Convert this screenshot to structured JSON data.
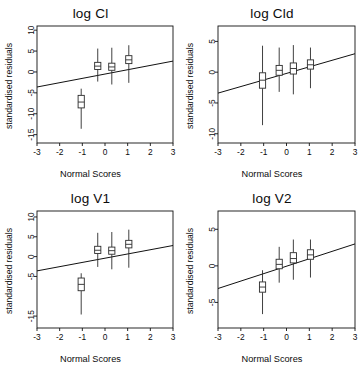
{
  "figure": {
    "background": "#ffffff",
    "layout": "2x2 grid of normal-score diagnostic box plots",
    "shared_xlabel": "Normal Scores",
    "shared_ylabel": "standardised residuals"
  },
  "chart_data": [
    {
      "type": "box",
      "title": "log Cl",
      "xlabel": "Normal Scores",
      "ylabel": "standardised residuals",
      "xlim": [
        -3,
        3
      ],
      "ylim": [
        -17,
        11
      ],
      "xticks": [
        -3,
        -2,
        -1,
        0,
        1,
        2,
        3
      ],
      "xticklabels": [
        "-3",
        "-2",
        "-1",
        "0",
        "1",
        "2",
        "3"
      ],
      "yticks": [
        -15,
        -10,
        -5,
        0,
        5,
        10
      ],
      "yticklabels": [
        "-15",
        "-10",
        "-5",
        "0",
        "5",
        "10"
      ],
      "grid": false,
      "legend": null,
      "boxes": [
        {
          "x": -1.05,
          "whisker_low": -13.6,
          "q1": -8.6,
          "median": -7.2,
          "q3": -5.6,
          "whisker_high": -4.0
        },
        {
          "x": -0.32,
          "whisker_low": -2.3,
          "q1": 0.6,
          "median": 1.4,
          "q3": 2.3,
          "whisker_high": 5.6
        },
        {
          "x": 0.3,
          "whisker_low": -3.0,
          "q1": 0.4,
          "median": 1.2,
          "q3": 2.1,
          "whisker_high": 5.8
        },
        {
          "x": 1.05,
          "whisker_low": -2.6,
          "q1": 2.0,
          "median": 2.9,
          "q3": 3.9,
          "whisker_high": 6.4
        }
      ],
      "reference_line": {
        "x0": -3,
        "y0": -3.6,
        "x1": 3,
        "y1": 2.6
      }
    },
    {
      "type": "box",
      "title": "log Cld",
      "xlabel": "Normal Scores",
      "ylabel": "standardised residuals",
      "xlim": [
        -3,
        3
      ],
      "ylim": [
        -11.5,
        7.5
      ],
      "xticks": [
        -3,
        -2,
        -1,
        0,
        1,
        2,
        3
      ],
      "xticklabels": [
        "-3",
        "-2",
        "-1",
        "0",
        "1",
        "2",
        "3"
      ],
      "yticks": [
        -10,
        -5,
        0,
        5
      ],
      "yticklabels": [
        "-10",
        "-5",
        "0",
        "5"
      ],
      "grid": false,
      "legend": null,
      "boxes": [
        {
          "x": -1.05,
          "whisker_low": -8.6,
          "q1": -2.6,
          "median": -1.3,
          "q3": -0.1,
          "whisker_high": 4.3
        },
        {
          "x": -0.32,
          "whisker_low": -3.2,
          "q1": -0.5,
          "median": 0.3,
          "q3": 1.1,
          "whisker_high": 4.0
        },
        {
          "x": 0.3,
          "whisker_low": -3.6,
          "q1": -0.3,
          "median": 0.6,
          "q3": 1.5,
          "whisker_high": 4.4
        },
        {
          "x": 1.05,
          "whisker_low": -2.6,
          "q1": 0.5,
          "median": 1.2,
          "q3": 2.0,
          "whisker_high": 4.0
        }
      ],
      "reference_line": {
        "x0": -3,
        "y0": -3.4,
        "x1": 3,
        "y1": 3.0
      }
    },
    {
      "type": "box",
      "title": "log V1",
      "xlabel": "Normal Scores",
      "ylabel": "standardised residuals",
      "xlim": [
        -3,
        3
      ],
      "ylim": [
        -18,
        11.5
      ],
      "xticks": [
        -3,
        -2,
        -1,
        0,
        1,
        2,
        3
      ],
      "xticklabels": [
        "-3",
        "-2",
        "-1",
        "0",
        "1",
        "2",
        "3"
      ],
      "yticks": [
        -15,
        -5,
        0,
        5,
        10
      ],
      "yticklabels": [
        "-15",
        "-5",
        "0",
        "5",
        "10"
      ],
      "grid": false,
      "legend": null,
      "boxes": [
        {
          "x": -1.05,
          "whisker_low": -14.6,
          "q1": -8.6,
          "median": -7.0,
          "q3": -5.4,
          "whisker_high": -4.2
        },
        {
          "x": -0.32,
          "whisker_low": -2.6,
          "q1": 0.8,
          "median": 1.6,
          "q3": 2.6,
          "whisker_high": 6.0
        },
        {
          "x": 0.3,
          "whisker_low": -3.2,
          "q1": 0.6,
          "median": 1.5,
          "q3": 2.4,
          "whisker_high": 6.2
        },
        {
          "x": 1.05,
          "whisker_low": -2.8,
          "q1": 2.2,
          "median": 3.1,
          "q3": 4.1,
          "whisker_high": 6.8
        }
      ],
      "reference_line": {
        "x0": -3,
        "y0": -3.6,
        "x1": 3,
        "y1": 2.8
      }
    },
    {
      "type": "box",
      "title": "log V2",
      "xlabel": "Normal Scores",
      "ylabel": "standardised residuals",
      "xlim": [
        -3,
        3
      ],
      "ylim": [
        -8.5,
        7.5
      ],
      "xticks": [
        -3,
        -2,
        -1,
        0,
        1,
        2,
        3
      ],
      "xticklabels": [
        "-3",
        "-2",
        "-1",
        "0",
        "1",
        "2",
        "3"
      ],
      "yticks": [
        -5,
        0,
        5
      ],
      "yticklabels": [
        "-5",
        "0",
        "5"
      ],
      "grid": false,
      "legend": null,
      "boxes": [
        {
          "x": -1.05,
          "whisker_low": -6.6,
          "q1": -3.6,
          "median": -2.9,
          "q3": -2.2,
          "whisker_high": -0.6
        },
        {
          "x": -0.32,
          "whisker_low": -2.3,
          "q1": -0.4,
          "median": 0.2,
          "q3": 0.9,
          "whisker_high": 2.6
        },
        {
          "x": 0.3,
          "whisker_low": -1.9,
          "q1": 0.4,
          "median": 1.0,
          "q3": 1.8,
          "whisker_high": 3.6
        },
        {
          "x": 1.05,
          "whisker_low": -1.6,
          "q1": 0.9,
          "median": 1.5,
          "q3": 2.2,
          "whisker_high": 3.6
        }
      ],
      "reference_line": {
        "x0": -3,
        "y0": -3.1,
        "x1": 3,
        "y1": 3.0
      }
    }
  ]
}
